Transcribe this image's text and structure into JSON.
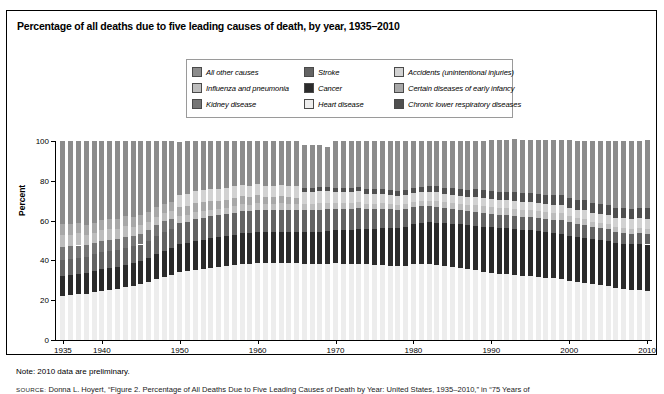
{
  "figure": {
    "title": "Percentage of all deaths due to five leading causes of death, by year, 1935–2010",
    "note": "Note: 2010 data are preliminary.",
    "source_prefix": "SOURCE:",
    "source": "Donna L. Hoyert, “Figure 2. Percentage of All Deaths Due to Five Leading Causes of Death by Year: United States, 1935–2010,” in “75 Years of"
  },
  "legend": {
    "items": [
      {
        "label": "All other causes",
        "color": "#8c8c8c",
        "key": "all_other"
      },
      {
        "label": "Stroke",
        "color": "#636363",
        "key": "stroke"
      },
      {
        "label": "Accidents (unintentional injuries)",
        "color": "#d2d2d2",
        "key": "accidents"
      },
      {
        "label": "Influenza and pneumonia",
        "color": "#bdbdbd",
        "key": "influenza"
      },
      {
        "label": "Cancer",
        "color": "#2b2b2b",
        "key": "cancer"
      },
      {
        "label": "Certain diseases of early infancy",
        "color": "#a8a8a8",
        "key": "infancy"
      },
      {
        "label": "Kidney disease",
        "color": "#767676",
        "key": "kidney"
      },
      {
        "label": "Heart disease",
        "color": "#ededed",
        "key": "heart"
      },
      {
        "label": "Chronic lower respiratory diseases",
        "color": "#4f4f4f",
        "key": "clrd"
      }
    ]
  },
  "chart_data": {
    "type": "bar",
    "stacked": true,
    "title": "Percentage of all deaths due to five leading causes of death, by year, 1935–2010",
    "xlabel": "",
    "ylabel": "Percent",
    "ylim": [
      0,
      100
    ],
    "yticks": [
      0,
      20,
      40,
      60,
      80,
      100
    ],
    "xticks": [
      1935,
      1940,
      1950,
      1960,
      1970,
      1980,
      1990,
      2000,
      2010
    ],
    "grid": false,
    "legend_position": "top-center",
    "x": [
      1935,
      1936,
      1937,
      1938,
      1939,
      1940,
      1941,
      1942,
      1943,
      1944,
      1945,
      1946,
      1947,
      1948,
      1949,
      1950,
      1951,
      1952,
      1953,
      1954,
      1955,
      1956,
      1957,
      1958,
      1959,
      1960,
      1961,
      1962,
      1963,
      1964,
      1965,
      1966,
      1967,
      1968,
      1969,
      1970,
      1971,
      1972,
      1973,
      1974,
      1975,
      1976,
      1977,
      1978,
      1979,
      1980,
      1981,
      1982,
      1983,
      1984,
      1985,
      1986,
      1987,
      1988,
      1989,
      1990,
      1991,
      1992,
      1993,
      1994,
      1995,
      1996,
      1997,
      1998,
      1999,
      2000,
      2001,
      2002,
      2003,
      2004,
      2005,
      2006,
      2007,
      2008,
      2009,
      2010
    ],
    "series": [
      {
        "name": "Heart disease",
        "key": "heart",
        "color": "#ededed",
        "values": [
          22.0,
          22.5,
          23.0,
          23.0,
          24.0,
          24.5,
          25.0,
          25.5,
          26.5,
          27.0,
          28.0,
          29.0,
          30.5,
          31.5,
          32.5,
          34.0,
          34.5,
          35.0,
          35.5,
          36.0,
          36.5,
          37.0,
          37.5,
          38.0,
          38.0,
          38.5,
          38.5,
          38.5,
          38.5,
          38.5,
          38.5,
          38.0,
          38.0,
          38.0,
          38.0,
          38.5,
          38.0,
          38.0,
          38.0,
          38.0,
          37.5,
          37.5,
          37.0,
          37.0,
          37.0,
          38.0,
          38.0,
          38.0,
          37.5,
          37.0,
          36.5,
          36.0,
          35.5,
          35.0,
          34.0,
          33.5,
          33.0,
          33.0,
          32.5,
          32.0,
          32.0,
          31.5,
          31.0,
          31.0,
          30.5,
          29.5,
          29.0,
          28.5,
          28.0,
          27.5,
          27.0,
          26.0,
          25.5,
          25.0,
          25.0,
          24.5
        ]
      },
      {
        "name": "Cancer",
        "key": "cancer",
        "color": "#2b2b2b",
        "values": [
          10.0,
          10.0,
          10.0,
          10.5,
          10.5,
          11.0,
          11.0,
          11.0,
          11.0,
          11.5,
          11.5,
          12.0,
          12.5,
          13.0,
          13.5,
          14.5,
          14.5,
          15.0,
          15.0,
          15.5,
          15.5,
          15.5,
          15.5,
          16.0,
          16.0,
          16.0,
          16.0,
          16.0,
          16.0,
          16.0,
          16.0,
          16.5,
          16.5,
          16.5,
          17.0,
          17.0,
          17.5,
          17.5,
          18.0,
          18.0,
          18.5,
          19.0,
          19.5,
          19.5,
          20.0,
          20.5,
          21.0,
          21.5,
          21.5,
          22.0,
          22.0,
          22.5,
          22.5,
          22.5,
          23.0,
          23.5,
          23.5,
          23.5,
          23.5,
          23.5,
          23.5,
          23.5,
          23.5,
          23.0,
          23.0,
          23.0,
          23.0,
          23.0,
          23.0,
          23.0,
          23.0,
          23.0,
          23.0,
          23.0,
          23.5,
          23.5
        ]
      },
      {
        "name": "Stroke",
        "key": "stroke",
        "color": "#636363",
        "values": [
          8.0,
          8.0,
          8.0,
          8.0,
          8.5,
          8.5,
          8.5,
          8.5,
          8.5,
          8.5,
          8.5,
          9.0,
          9.5,
          10.0,
          10.0,
          10.5,
          10.5,
          11.0,
          11.0,
          11.0,
          11.0,
          11.0,
          11.0,
          11.0,
          11.0,
          11.0,
          11.0,
          11.0,
          11.0,
          11.0,
          11.0,
          11.0,
          11.0,
          11.0,
          11.0,
          10.5,
          10.5,
          10.5,
          10.5,
          10.0,
          10.0,
          9.5,
          9.5,
          9.0,
          9.0,
          8.5,
          8.5,
          8.0,
          8.0,
          7.5,
          7.5,
          7.0,
          7.0,
          7.0,
          7.0,
          6.5,
          6.5,
          6.5,
          6.5,
          6.5,
          6.5,
          6.5,
          6.5,
          6.5,
          7.0,
          7.0,
          6.5,
          6.5,
          6.0,
          6.0,
          6.0,
          5.5,
          5.5,
          5.5,
          5.5,
          5.5
        ]
      },
      {
        "name": "Kidney disease",
        "key": "kidney",
        "color": "#767676",
        "values": [
          6.5,
          6.5,
          6.5,
          6.0,
          6.0,
          6.0,
          6.0,
          6.0,
          6.0,
          5.5,
          5.5,
          5.5,
          5.5,
          5.5,
          5.0,
          0,
          0,
          0,
          0,
          0,
          0,
          0,
          0,
          0,
          0,
          0,
          0,
          0,
          0,
          0,
          0,
          0,
          0,
          0,
          0,
          0,
          0,
          0,
          0,
          0,
          0,
          0,
          0,
          0,
          0,
          0,
          0,
          0,
          0,
          0,
          0,
          0,
          0,
          0,
          0,
          0,
          0,
          0,
          0,
          0,
          0,
          0,
          0,
          0,
          0,
          0,
          0,
          0,
          0,
          0,
          0,
          0,
          0,
          0,
          0,
          0
        ]
      },
      {
        "name": "Influenza and pneumonia",
        "key": "influenza",
        "color": "#bdbdbd",
        "values": [
          6.5,
          6.0,
          6.5,
          5.5,
          5.0,
          5.5,
          5.5,
          5.0,
          5.5,
          4.5,
          4.5,
          4.0,
          4.0,
          4.0,
          4.0,
          3.5,
          3.5,
          3.5,
          3.5,
          3.0,
          3.0,
          3.0,
          3.5,
          3.5,
          3.0,
          3.5,
          3.0,
          3.0,
          3.5,
          3.0,
          3.0,
          3.0,
          3.0,
          3.5,
          3.0,
          3.0,
          3.0,
          3.0,
          3.0,
          2.5,
          2.5,
          3.0,
          2.5,
          2.5,
          2.5,
          2.5,
          2.5,
          2.5,
          3.0,
          3.0,
          3.0,
          3.0,
          3.0,
          3.5,
          3.5,
          3.5,
          3.5,
          3.5,
          3.5,
          3.5,
          3.5,
          3.5,
          3.5,
          3.5,
          3.5,
          3.0,
          3.0,
          3.0,
          2.5,
          2.5,
          2.5,
          2.5,
          2.5,
          2.5,
          2.5,
          2.5
        ]
      },
      {
        "name": "Certain diseases of early infancy",
        "key": "infancy",
        "color": "#a8a8a8",
        "values": [
          5.5,
          5.5,
          5.0,
          5.0,
          5.0,
          5.0,
          5.0,
          5.0,
          5.0,
          5.0,
          5.0,
          5.0,
          5.0,
          4.5,
          4.5,
          4.5,
          4.5,
          4.5,
          4.5,
          4.5,
          4.0,
          4.0,
          4.0,
          4.0,
          4.0,
          4.0,
          3.5,
          3.5,
          3.5,
          3.5,
          3.0,
          0,
          0,
          0,
          0,
          0,
          0,
          0,
          0,
          0,
          0,
          0,
          0,
          0,
          0,
          0,
          0,
          0,
          0,
          0,
          0,
          0,
          0,
          0,
          0,
          0,
          0,
          0,
          0,
          0,
          0,
          0,
          0,
          0,
          0,
          0,
          0,
          0,
          0,
          0,
          0,
          0,
          0,
          0,
          0,
          0
        ]
      },
      {
        "name": "Accidents (unintentional injuries)",
        "key": "accidents",
        "color": "#d2d2d2",
        "values": [
          0,
          0,
          0,
          0,
          0,
          0,
          0,
          0,
          0,
          0,
          0,
          0,
          0,
          0,
          0,
          6.0,
          6.0,
          6.0,
          6.0,
          6.0,
          6.0,
          6.0,
          6.0,
          5.5,
          5.5,
          5.5,
          5.5,
          5.5,
          5.5,
          5.5,
          6.0,
          6.0,
          6.0,
          6.0,
          6.0,
          5.5,
          5.5,
          5.5,
          5.5,
          5.0,
          5.0,
          4.5,
          4.5,
          4.5,
          4.5,
          4.5,
          4.5,
          4.5,
          4.5,
          4.0,
          4.0,
          4.0,
          4.0,
          4.0,
          4.0,
          4.0,
          4.0,
          4.0,
          4.0,
          4.0,
          4.0,
          4.0,
          4.0,
          4.0,
          4.0,
          4.0,
          4.0,
          4.5,
          4.5,
          4.5,
          4.5,
          4.5,
          5.0,
          5.0,
          5.0,
          5.0
        ]
      },
      {
        "name": "Chronic lower respiratory diseases",
        "key": "clrd",
        "color": "#4f4f4f",
        "values": [
          0,
          0,
          0,
          0,
          0,
          0,
          0,
          0,
          0,
          0,
          0,
          0,
          0,
          0,
          0,
          0,
          0,
          0,
          0,
          0,
          0,
          0,
          0,
          0,
          0,
          0,
          0,
          0,
          0,
          0,
          0,
          2.0,
          2.0,
          2.0,
          2.0,
          2.0,
          2.0,
          2.0,
          2.0,
          2.5,
          2.5,
          2.5,
          2.5,
          2.5,
          2.5,
          2.5,
          2.5,
          3.0,
          3.0,
          3.0,
          3.5,
          3.5,
          3.5,
          4.0,
          4.0,
          4.0,
          4.0,
          4.0,
          4.5,
          4.5,
          4.5,
          4.5,
          4.5,
          5.0,
          5.0,
          5.0,
          5.0,
          5.0,
          5.0,
          5.0,
          5.0,
          5.0,
          5.0,
          5.0,
          5.0,
          5.5
        ]
      },
      {
        "name": "All other causes",
        "key": "all_other",
        "color": "#8c8c8c",
        "values": [
          41.5,
          41.5,
          41.0,
          42.0,
          41.0,
          39.5,
          39.0,
          39.0,
          37.5,
          38.0,
          37.0,
          35.5,
          33.0,
          31.5,
          30.5,
          26.5,
          26.5,
          25.0,
          24.5,
          24.0,
          24.0,
          23.5,
          22.5,
          22.0,
          22.5,
          21.5,
          22.5,
          22.5,
          22.0,
          22.5,
          22.5,
          21.5,
          21.5,
          21.0,
          20.0,
          23.5,
          23.5,
          23.5,
          23.0,
          24.0,
          24.0,
          24.0,
          24.5,
          25.0,
          24.5,
          23.5,
          23.0,
          22.5,
          22.5,
          23.5,
          23.5,
          24.0,
          24.5,
          24.0,
          24.5,
          25.5,
          26.0,
          26.0,
          26.5,
          26.5,
          26.5,
          27.0,
          27.5,
          27.5,
          27.5,
          29.0,
          29.5,
          29.5,
          31.0,
          31.5,
          32.0,
          33.5,
          33.5,
          34.0,
          33.5,
          34.0
        ]
      }
    ],
    "stack_order": [
      "heart",
      "cancer",
      "stroke",
      "kidney",
      "influenza",
      "infancy",
      "accidents",
      "clrd",
      "all_other"
    ]
  }
}
